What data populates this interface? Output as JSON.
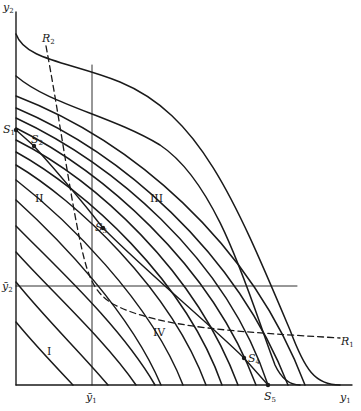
{
  "diagram": {
    "axes": {
      "x_label": "y1",
      "y_label": "y2",
      "x_bar_label": "ȳ1",
      "y_bar_label": "ȳ2",
      "origin": [
        16,
        385
      ],
      "x_end": 352,
      "y_top": 12
    },
    "reference_lines": {
      "vertical_ybar1_x": 92,
      "vertical_top_y": 65,
      "horizontal_ybar2_y": 286,
      "horizontal_end_x": 297
    },
    "regions": [
      {
        "id": "I",
        "label": "I",
        "x": 47,
        "y": 346
      },
      {
        "id": "II",
        "label": "II",
        "x": 35,
        "y": 193
      },
      {
        "id": "III",
        "label": "III",
        "x": 150,
        "y": 193
      },
      {
        "id": "IV",
        "label": "IV",
        "x": 153,
        "y": 327
      }
    ],
    "points": [
      {
        "id": "S1",
        "label": "S",
        "sub": "1",
        "x": 16,
        "y": 130,
        "lx": 3,
        "ly": 124
      },
      {
        "id": "S2",
        "label": "S",
        "sub": "2",
        "x": 34,
        "y": 146,
        "lx": 31,
        "ly": 134
      },
      {
        "id": "S3",
        "label": "S",
        "sub": "3",
        "x": 103,
        "y": 228,
        "lx": 95,
        "ly": 222
      },
      {
        "id": "S4",
        "label": "S",
        "sub": "4",
        "x": 244,
        "y": 358,
        "lx": 248,
        "ly": 353
      },
      {
        "id": "S5",
        "label": "S",
        "sub": "5",
        "x": 268,
        "y": 385,
        "lx": 264,
        "ly": 391
      }
    ],
    "dashed_curves": [
      {
        "id": "R1",
        "label": "R",
        "sub": "1",
        "lx": 341,
        "ly": 366
      },
      {
        "id": "R2",
        "label": "R",
        "sub": "2",
        "lx": 42,
        "ly": 33
      }
    ],
    "curve_count": 16
  }
}
